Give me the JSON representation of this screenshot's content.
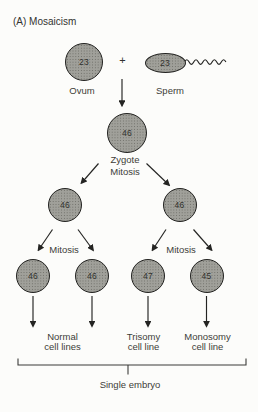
{
  "title": "(A) Mosaicism",
  "cells": {
    "ovum": {
      "count": "23",
      "label": "Ovum"
    },
    "sperm": {
      "count": "23",
      "label": "Sperm"
    },
    "zygote": {
      "count": "46",
      "label": "Zygote",
      "process": "Mitosis"
    },
    "generation2": [
      {
        "count": "46"
      },
      {
        "count": "46"
      }
    ],
    "generation3": [
      {
        "count": "46"
      },
      {
        "count": "46"
      },
      {
        "count": "47"
      },
      {
        "count": "45"
      }
    ]
  },
  "process_labels": {
    "plus": "+",
    "mitosis_left": "Mitosis",
    "mitosis_right": "Mitosis"
  },
  "outcomes": [
    {
      "line1": "Normal",
      "line2": "cell lines"
    },
    {
      "line1": "Trisomy",
      "line2": "cell line"
    },
    {
      "line1": "Monosomy",
      "line2": "cell line"
    }
  ],
  "bracket_label": "Single embryo",
  "colors": {
    "background": "#fcfcfa",
    "cell_fill": "#a0a09a",
    "cell_outline": "#222220",
    "line": "#242422",
    "text": "#3c3c38"
  }
}
